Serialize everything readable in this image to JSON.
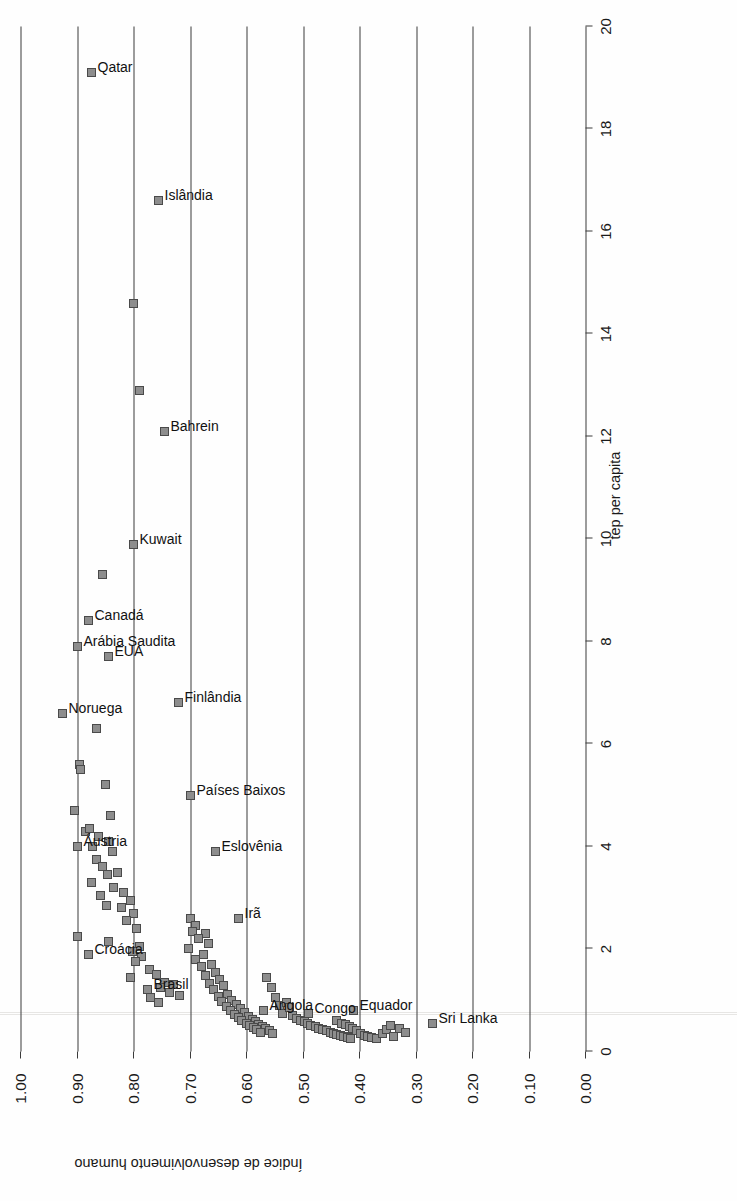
{
  "chart_data": {
    "type": "scatter",
    "title": "",
    "xlabel": "tep per capita",
    "ylabel": "Índice de desenvolvimento humano",
    "xlim": [
      0,
      20
    ],
    "ylim": [
      0.0,
      1.0
    ],
    "xticks": [
      "0",
      "2",
      "4",
      "6",
      "8",
      "10",
      "12",
      "14",
      "16",
      "18",
      "20"
    ],
    "yticks": [
      "0.00",
      "0.10",
      "0.20",
      "0.30",
      "0.40",
      "0.50",
      "0.60",
      "0.70",
      "0.80",
      "0.90",
      "1.00"
    ],
    "grid": "horizontal-hdi-lines",
    "legend": "none",
    "rotation_deg": -90,
    "marker": {
      "shape": "square",
      "fill": "#8d8d8d",
      "stroke": "#4a4a4a",
      "size_px": 9
    },
    "labeled_points": [
      {
        "label": "Qatar",
        "x": 19.1,
        "y": 0.875
      },
      {
        "label": "Islândia",
        "x": 16.6,
        "y": 0.755
      },
      {
        "label": "Bahrein",
        "x": 12.1,
        "y": 0.745
      },
      {
        "label": "Kuwait",
        "x": 9.9,
        "y": 0.8
      },
      {
        "label": "Arábia Saudita",
        "x": 7.9,
        "y": 0.9
      },
      {
        "label": "Canadá",
        "x": 8.4,
        "y": 0.88
      },
      {
        "label": "Noruega",
        "x": 6.6,
        "y": 0.925
      },
      {
        "label": "EUA",
        "x": 7.7,
        "y": 0.845
      },
      {
        "label": "Áustria",
        "x": 4.0,
        "y": 0.9
      },
      {
        "label": "Países Baixos",
        "x": 5.0,
        "y": 0.7
      },
      {
        "label": "Finlândia",
        "x": 6.8,
        "y": 0.72
      },
      {
        "label": "Eslovênia",
        "x": 3.9,
        "y": 0.655
      },
      {
        "label": "Croácia",
        "x": 1.9,
        "y": 0.88
      },
      {
        "label": "Brasil",
        "x": 1.2,
        "y": 0.775
      },
      {
        "label": "Irã",
        "x": 2.6,
        "y": 0.615
      },
      {
        "label": "Angola",
        "x": 0.8,
        "y": 0.57
      },
      {
        "label": "Congo",
        "x": 0.75,
        "y": 0.49
      },
      {
        "label": "Equador",
        "x": 0.8,
        "y": 0.41
      },
      {
        "label": "Sri Lanka",
        "x": 0.55,
        "y": 0.27
      }
    ],
    "unlabeled_points": [
      {
        "x": 14.6,
        "y": 0.8
      },
      {
        "x": 12.9,
        "y": 0.79
      },
      {
        "x": 9.3,
        "y": 0.855
      },
      {
        "x": 6.3,
        "y": 0.865
      },
      {
        "x": 5.6,
        "y": 0.895
      },
      {
        "x": 5.5,
        "y": 0.893
      },
      {
        "x": 5.2,
        "y": 0.85
      },
      {
        "x": 4.6,
        "y": 0.84
      },
      {
        "x": 4.7,
        "y": 0.905
      },
      {
        "x": 4.3,
        "y": 0.885
      },
      {
        "x": 4.35,
        "y": 0.878
      },
      {
        "x": 4.2,
        "y": 0.862
      },
      {
        "x": 4.1,
        "y": 0.845
      },
      {
        "x": 4.0,
        "y": 0.872
      },
      {
        "x": 3.9,
        "y": 0.838
      },
      {
        "x": 3.75,
        "y": 0.866
      },
      {
        "x": 3.6,
        "y": 0.855
      },
      {
        "x": 3.5,
        "y": 0.828
      },
      {
        "x": 3.45,
        "y": 0.846
      },
      {
        "x": 3.3,
        "y": 0.875
      },
      {
        "x": 3.2,
        "y": 0.836
      },
      {
        "x": 3.1,
        "y": 0.818
      },
      {
        "x": 3.05,
        "y": 0.858
      },
      {
        "x": 2.95,
        "y": 0.806
      },
      {
        "x": 2.85,
        "y": 0.848
      },
      {
        "x": 2.8,
        "y": 0.822
      },
      {
        "x": 2.7,
        "y": 0.8
      },
      {
        "x": 2.55,
        "y": 0.812
      },
      {
        "x": 2.4,
        "y": 0.795
      },
      {
        "x": 2.25,
        "y": 0.9
      },
      {
        "x": 2.15,
        "y": 0.845
      },
      {
        "x": 2.05,
        "y": 0.79
      },
      {
        "x": 1.95,
        "y": 0.802
      },
      {
        "x": 1.85,
        "y": 0.786
      },
      {
        "x": 1.75,
        "y": 0.796
      },
      {
        "x": 1.6,
        "y": 0.772
      },
      {
        "x": 1.5,
        "y": 0.76
      },
      {
        "x": 1.45,
        "y": 0.805
      },
      {
        "x": 1.35,
        "y": 0.745
      },
      {
        "x": 1.3,
        "y": 0.73
      },
      {
        "x": 1.25,
        "y": 0.752
      },
      {
        "x": 1.15,
        "y": 0.736
      },
      {
        "x": 1.1,
        "y": 0.718
      },
      {
        "x": 1.05,
        "y": 0.77
      },
      {
        "x": 0.95,
        "y": 0.756
      },
      {
        "x": 2.6,
        "y": 0.7
      },
      {
        "x": 2.45,
        "y": 0.69
      },
      {
        "x": 2.35,
        "y": 0.695
      },
      {
        "x": 2.3,
        "y": 0.672
      },
      {
        "x": 2.2,
        "y": 0.685
      },
      {
        "x": 2.1,
        "y": 0.668
      },
      {
        "x": 2.0,
        "y": 0.702
      },
      {
        "x": 1.9,
        "y": 0.676
      },
      {
        "x": 1.8,
        "y": 0.69
      },
      {
        "x": 1.7,
        "y": 0.662
      },
      {
        "x": 1.65,
        "y": 0.68
      },
      {
        "x": 1.55,
        "y": 0.655
      },
      {
        "x": 1.48,
        "y": 0.672
      },
      {
        "x": 1.4,
        "y": 0.648
      },
      {
        "x": 1.32,
        "y": 0.666
      },
      {
        "x": 1.28,
        "y": 0.64
      },
      {
        "x": 1.2,
        "y": 0.658
      },
      {
        "x": 1.12,
        "y": 0.634
      },
      {
        "x": 1.08,
        "y": 0.65
      },
      {
        "x": 1.0,
        "y": 0.626
      },
      {
        "x": 0.98,
        "y": 0.644
      },
      {
        "x": 0.92,
        "y": 0.618
      },
      {
        "x": 0.88,
        "y": 0.636
      },
      {
        "x": 0.84,
        "y": 0.61
      },
      {
        "x": 0.8,
        "y": 0.628
      },
      {
        "x": 0.76,
        "y": 0.604
      },
      {
        "x": 0.72,
        "y": 0.622
      },
      {
        "x": 0.68,
        "y": 0.596
      },
      {
        "x": 0.66,
        "y": 0.614
      },
      {
        "x": 0.62,
        "y": 0.59
      },
      {
        "x": 0.6,
        "y": 0.608
      },
      {
        "x": 0.58,
        "y": 0.584
      },
      {
        "x": 0.55,
        "y": 0.6
      },
      {
        "x": 0.52,
        "y": 0.578
      },
      {
        "x": 0.5,
        "y": 0.594
      },
      {
        "x": 0.48,
        "y": 0.572
      },
      {
        "x": 0.46,
        "y": 0.588
      },
      {
        "x": 0.44,
        "y": 0.566
      },
      {
        "x": 0.42,
        "y": 0.582
      },
      {
        "x": 0.4,
        "y": 0.56
      },
      {
        "x": 0.38,
        "y": 0.576
      },
      {
        "x": 0.36,
        "y": 0.554
      },
      {
        "x": 1.45,
        "y": 0.565
      },
      {
        "x": 1.25,
        "y": 0.556
      },
      {
        "x": 1.05,
        "y": 0.548
      },
      {
        "x": 0.9,
        "y": 0.542
      },
      {
        "x": 0.75,
        "y": 0.536
      },
      {
        "x": 0.95,
        "y": 0.53
      },
      {
        "x": 0.85,
        "y": 0.524
      },
      {
        "x": 0.7,
        "y": 0.518
      },
      {
        "x": 0.65,
        "y": 0.512
      },
      {
        "x": 0.6,
        "y": 0.505
      },
      {
        "x": 0.58,
        "y": 0.498
      },
      {
        "x": 0.55,
        "y": 0.492
      },
      {
        "x": 0.5,
        "y": 0.486
      },
      {
        "x": 0.48,
        "y": 0.478
      },
      {
        "x": 0.45,
        "y": 0.472
      },
      {
        "x": 0.42,
        "y": 0.466
      },
      {
        "x": 0.4,
        "y": 0.458
      },
      {
        "x": 0.38,
        "y": 0.452
      },
      {
        "x": 0.36,
        "y": 0.446
      },
      {
        "x": 0.34,
        "y": 0.44
      },
      {
        "x": 0.32,
        "y": 0.434
      },
      {
        "x": 0.3,
        "y": 0.428
      },
      {
        "x": 0.28,
        "y": 0.422
      },
      {
        "x": 0.26,
        "y": 0.416
      },
      {
        "x": 0.6,
        "y": 0.44
      },
      {
        "x": 0.55,
        "y": 0.432
      },
      {
        "x": 0.52,
        "y": 0.424
      },
      {
        "x": 0.48,
        "y": 0.418
      },
      {
        "x": 0.44,
        "y": 0.412
      },
      {
        "x": 0.4,
        "y": 0.405
      },
      {
        "x": 0.36,
        "y": 0.398
      },
      {
        "x": 0.32,
        "y": 0.392
      },
      {
        "x": 0.3,
        "y": 0.386
      },
      {
        "x": 0.28,
        "y": 0.378
      },
      {
        "x": 0.26,
        "y": 0.37
      },
      {
        "x": 0.35,
        "y": 0.36
      },
      {
        "x": 0.42,
        "y": 0.352
      },
      {
        "x": 0.5,
        "y": 0.345
      },
      {
        "x": 0.3,
        "y": 0.34
      },
      {
        "x": 0.45,
        "y": 0.33
      },
      {
        "x": 0.38,
        "y": 0.318
      }
    ]
  },
  "axes": {
    "x_label": "tep per capita",
    "y_label": "Índice de desenvolvimento humano"
  }
}
